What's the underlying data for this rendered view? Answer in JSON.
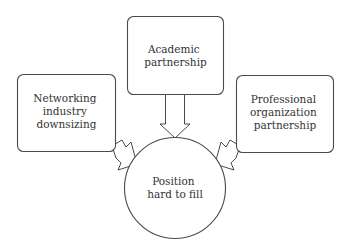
{
  "diagram": {
    "type": "cause-effect",
    "nodes": {
      "academic": {
        "shape": "rounded-rectangle",
        "lines": [
          "Academic",
          "partnership"
        ]
      },
      "networking": {
        "shape": "rounded-rectangle",
        "lines": [
          "Networking",
          "industry",
          "downsizing"
        ]
      },
      "professional": {
        "shape": "rounded-rectangle",
        "lines": [
          "Professional",
          "organization",
          "partnership"
        ]
      },
      "position": {
        "shape": "circle",
        "lines": [
          "Position",
          "hard to fill"
        ]
      }
    },
    "edges": [
      {
        "from": "academic",
        "to": "position",
        "style": "block-arrow"
      },
      {
        "from": "networking",
        "to": "position",
        "style": "block-arrow"
      },
      {
        "from": "professional",
        "to": "position",
        "style": "block-arrow"
      }
    ],
    "colors": {
      "stroke": "#4a4a4a",
      "text": "#333333",
      "background": "#ffffff"
    }
  }
}
